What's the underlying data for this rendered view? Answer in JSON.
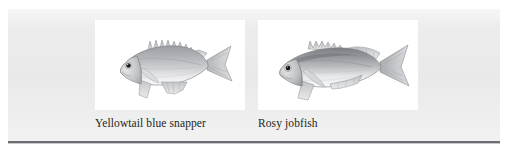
{
  "figure": {
    "background_color": "#ffffff",
    "plate_color": "#ececec",
    "rule_color": "#6e6e72",
    "label_color": "#231f20",
    "specimens": [
      {
        "label": "Yellowtail blue snapper",
        "image_name": "yellowtail-blue-snapper-illustration",
        "image_alt": "Grayscale scientific illustration of a yellowtail blue snapper, a deep-bodied fish facing left with a long spiny dorsal fin and a forked tail",
        "body_tone": "#b6b8bb",
        "belly_tone": "#f2f2f3",
        "outline_tone": "#6f7174",
        "eye_color": "#1b1b1d"
      },
      {
        "label": "Rosy jobfish",
        "image_name": "rosy-jobfish-illustration",
        "image_alt": "Grayscale scientific illustration of a rosy jobfish, an elongated streamlined fish facing left with a dark back, pale belly and a deeply forked tail",
        "body_tone": "#9fa2a6",
        "belly_tone": "#f4f4f5",
        "outline_tone": "#67696c",
        "eye_color": "#18181a"
      }
    ]
  }
}
